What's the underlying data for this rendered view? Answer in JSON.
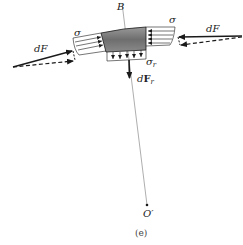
{
  "figure": {
    "caption": "(e)",
    "labels": {
      "point_B": "B",
      "sigma_left": "σ",
      "sigma_right": "σ",
      "sigma_r": "σ",
      "sigma_r_sub": "r",
      "dF_left": "dF",
      "dF_right": "dF",
      "dFr_d": "d",
      "dFr_F": "F",
      "dFr_sub": "r",
      "center": "O′"
    },
    "colors": {
      "line": "#1a1a1a",
      "block_fill": "#7a7a7a",
      "block_fill_light": "#a6a6a6",
      "radial_line": "#666666"
    }
  }
}
